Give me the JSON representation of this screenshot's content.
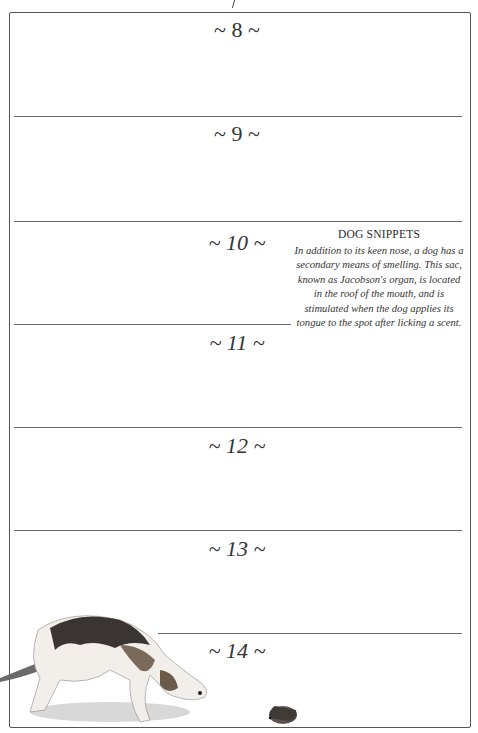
{
  "page": {
    "days": [
      {
        "label": "~ 8 ~",
        "italic": false
      },
      {
        "label": "~ 9 ~",
        "italic": false
      },
      {
        "label": "~ 10 ~",
        "italic": true
      },
      {
        "label": "~ 11 ~",
        "italic": true
      },
      {
        "label": "~ 12 ~",
        "italic": true
      },
      {
        "label": "~ 13 ~",
        "italic": true
      },
      {
        "label": "~ 14 ~",
        "italic": true
      }
    ]
  },
  "sidebar": {
    "title": "DOG SNIPPETS",
    "body": "In addition to its keen nose, a dog has a secondary means of smelling. This sac, known as Jacobson's organ, is located in the roof of the mouth, and is stimulated when the dog applies its tongue to the spot after licking a scent."
  },
  "illustration": {
    "subjects": [
      "beagle-dog",
      "hedgehog"
    ]
  },
  "colors": {
    "line": "#6a6a6a",
    "text": "#2b2b2b",
    "background": "#ffffff"
  }
}
